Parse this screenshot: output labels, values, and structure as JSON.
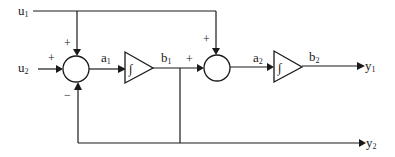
{
  "diagram": {
    "type": "block-diagram",
    "inputs": [
      {
        "id": "u1",
        "label": "u",
        "sub": "1"
      },
      {
        "id": "u2",
        "label": "u",
        "sub": "2"
      }
    ],
    "outputs": [
      {
        "id": "y1",
        "label": "y",
        "sub": "1"
      },
      {
        "id": "y2",
        "label": "y",
        "sub": "2"
      }
    ],
    "signals": [
      {
        "id": "a1",
        "label": "a",
        "sub": "1"
      },
      {
        "id": "b1",
        "label": "b",
        "sub": "1"
      },
      {
        "id": "a2",
        "label": "a",
        "sub": "2"
      },
      {
        "id": "b2",
        "label": "b",
        "sub": "2"
      }
    ],
    "summers": [
      {
        "id": "sum1",
        "signs": {
          "top": "+",
          "left": "+",
          "bottom": "−"
        }
      },
      {
        "id": "sum2",
        "signs": {
          "top": "+",
          "left": "+"
        }
      }
    ],
    "integrators": [
      {
        "id": "int1",
        "symbol": "∫"
      },
      {
        "id": "int2",
        "symbol": "∫"
      }
    ],
    "edges": [
      [
        "u1",
        "sum1.top"
      ],
      [
        "u2",
        "sum1.left"
      ],
      [
        "sum1",
        "int1"
      ],
      [
        "int1",
        "sum2.left"
      ],
      [
        "u1",
        "sum2.top"
      ],
      [
        "sum2",
        "int2"
      ],
      [
        "int2",
        "y1"
      ],
      [
        "b1",
        "y2"
      ],
      [
        "b1",
        "sum1.bottom"
      ]
    ],
    "colors": {
      "stroke": "#1a1a1a",
      "background": "#ffffff"
    }
  }
}
